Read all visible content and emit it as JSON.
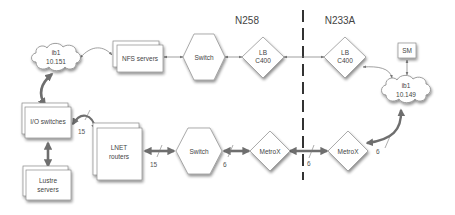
{
  "diagram": {
    "regions": {
      "left": "N258",
      "right": "N233A"
    },
    "nodes": {
      "ib1_left": {
        "line1": "ib1",
        "line2": "10.151",
        "shape": "cloud"
      },
      "nfs_servers": {
        "label": "NFS servers",
        "shape": "stacked-box"
      },
      "switch_top": {
        "label": "Switch",
        "shape": "hexagon"
      },
      "lb_c400_left": {
        "line1": "LB",
        "line2": "C400",
        "shape": "diamond"
      },
      "lb_c400_right": {
        "line1": "LB",
        "line2": "C400",
        "shape": "diamond"
      },
      "sm": {
        "label": "SM",
        "shape": "box"
      },
      "ib1_right": {
        "line1": "ib1",
        "line2": "10.149",
        "shape": "cloud"
      },
      "io_switches": {
        "label": "I/O switches",
        "shape": "stacked-box"
      },
      "lnet_routers": {
        "line1": "LNET",
        "line2": "routers",
        "shape": "stacked-box"
      },
      "switch_bottom": {
        "label": "Switch",
        "shape": "hexagon"
      },
      "metrox_left": {
        "label": "MetroX",
        "shape": "diamond"
      },
      "metrox_right": {
        "label": "MetroX",
        "shape": "diamond"
      },
      "lustre_servers": {
        "line1": "Lustre",
        "line2": "servers",
        "shape": "stacked-box"
      }
    },
    "link_counts": {
      "io_to_lnet": "15",
      "lnet_to_switch": "15",
      "switch_to_metrox": "6",
      "metrox_to_metrox": "6",
      "metrox_to_ib1": "6"
    },
    "colors": {
      "line": "#777777",
      "thick_line": "#6e6e6e",
      "node_fill": "#ffffff",
      "node_stroke": "#8a8a8a",
      "divider": "#333333"
    }
  }
}
